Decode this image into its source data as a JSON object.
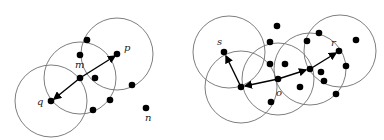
{
  "left_diagram": {
    "labels": {
      "m": "m",
      "p": "p",
      "q": "q",
      "n": "n"
    },
    "circles": [
      {
        "cx": 51,
        "cy": 101,
        "r": 36
      },
      {
        "cx": 80,
        "cy": 78,
        "r": 36
      },
      {
        "cx": 117,
        "cy": 54,
        "r": 36
      }
    ],
    "points": [
      {
        "x": 51,
        "y": 101
      },
      {
        "x": 80,
        "y": 78
      },
      {
        "x": 117,
        "y": 54
      },
      {
        "x": 87,
        "y": 40
      },
      {
        "x": 80,
        "y": 55
      },
      {
        "x": 95,
        "y": 78
      },
      {
        "x": 132,
        "y": 85
      },
      {
        "x": 110,
        "y": 100
      },
      {
        "x": 93,
        "y": 110
      },
      {
        "x": 146,
        "y": 108
      }
    ]
  },
  "right_diagram": {
    "labels": {
      "s": "s",
      "o": "o",
      "r": "r"
    },
    "circles": [
      {
        "cx": 229,
        "cy": 52,
        "r": 36
      },
      {
        "cx": 241,
        "cy": 87,
        "r": 36
      },
      {
        "cx": 278,
        "cy": 79,
        "r": 36
      },
      {
        "cx": 310,
        "cy": 69,
        "r": 36
      },
      {
        "cx": 340,
        "cy": 51,
        "r": 36
      }
    ],
    "points": [
      {
        "x": 224,
        "y": 52
      },
      {
        "x": 241,
        "y": 87
      },
      {
        "x": 278,
        "y": 79
      },
      {
        "x": 310,
        "y": 69
      },
      {
        "x": 339,
        "y": 51
      },
      {
        "x": 277,
        "y": 26
      },
      {
        "x": 270,
        "y": 42
      },
      {
        "x": 270,
        "y": 64
      },
      {
        "x": 285,
        "y": 64
      },
      {
        "x": 300,
        "y": 87
      },
      {
        "x": 271,
        "y": 102
      },
      {
        "x": 307,
        "y": 41
      },
      {
        "x": 319,
        "y": 33
      },
      {
        "x": 356,
        "y": 40
      },
      {
        "x": 346,
        "y": 66
      },
      {
        "x": 321,
        "y": 72
      },
      {
        "x": 324,
        "y": 81
      },
      {
        "x": 336,
        "y": 94
      }
    ]
  }
}
